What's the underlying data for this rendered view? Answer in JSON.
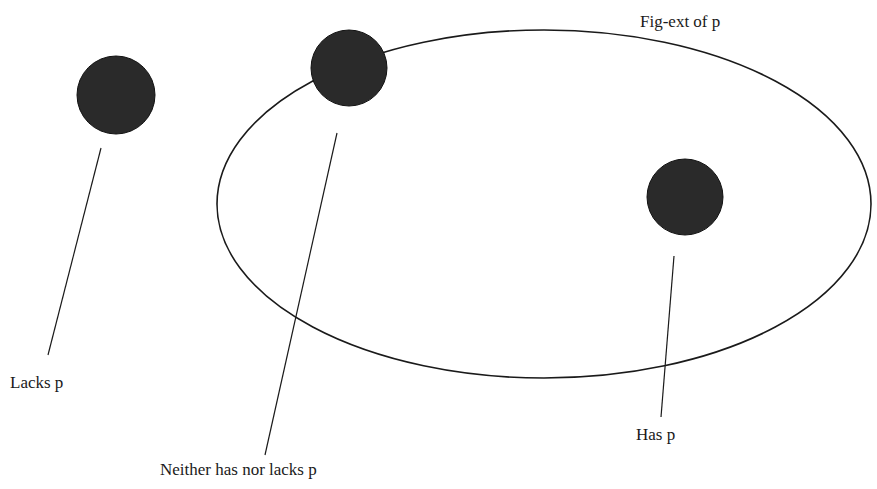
{
  "diagram": {
    "type": "venn-extension",
    "colors": {
      "ink": "#1a1a1a",
      "dot": "#2a2a2a",
      "background": "#ffffff"
    },
    "region": {
      "label": "Fig-ext of p",
      "shape": "ellipse",
      "cx": 544,
      "cy": 204,
      "rx": 327,
      "ry": 174
    },
    "objects": [
      {
        "id": "lacks",
        "label": "Lacks p",
        "cx": 116,
        "cy": 95,
        "r": 39,
        "leader": {
          "x1": 101,
          "y1": 148,
          "x2": 48,
          "y2": 355
        },
        "label_pos": {
          "x": 10,
          "y": 388
        }
      },
      {
        "id": "neither",
        "label": "Neither has nor lacks p",
        "cx": 349,
        "cy": 68,
        "r": 38,
        "leader": {
          "x1": 337,
          "y1": 133,
          "x2": 265,
          "y2": 455
        },
        "label_pos": {
          "x": 160,
          "y": 475
        }
      },
      {
        "id": "has",
        "label": "Has p",
        "cx": 685,
        "cy": 197,
        "r": 38,
        "leader": {
          "x1": 674,
          "y1": 256,
          "x2": 661,
          "y2": 417
        },
        "label_pos": {
          "x": 636,
          "y": 440
        }
      }
    ],
    "region_label_pos": {
      "x": 640,
      "y": 27
    }
  }
}
